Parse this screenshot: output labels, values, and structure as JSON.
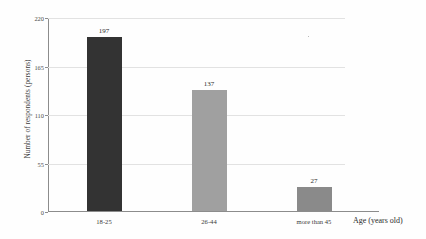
{
  "chart_data": {
    "type": "bar",
    "title": "",
    "subtitle": "",
    "xlabel": "Age (years old)",
    "ylabel": "Number of respondents (persons)",
    "categories": [
      "18-25",
      "26-44",
      "more than 45"
    ],
    "values": [
      197,
      137,
      27
    ],
    "value_labels": [
      "197",
      "137",
      "27"
    ],
    "bar_colors": [
      "#333333",
      "#a0a0a0",
      "#8a8a8a"
    ],
    "ylim": [
      0,
      220
    ],
    "yticks": [
      0,
      55,
      110,
      165,
      220
    ],
    "ytick_labels": [
      "0",
      "55",
      "110",
      "165",
      "220"
    ],
    "grid": true,
    "grid_axis": "y",
    "grid_color": "#e2e2e2",
    "legend": false,
    "legend_position": "none",
    "axis_color": "#8c8c8c",
    "background_color": "#fefefe"
  },
  "figure": {
    "name": "bar-chart-respondents-by-age"
  }
}
